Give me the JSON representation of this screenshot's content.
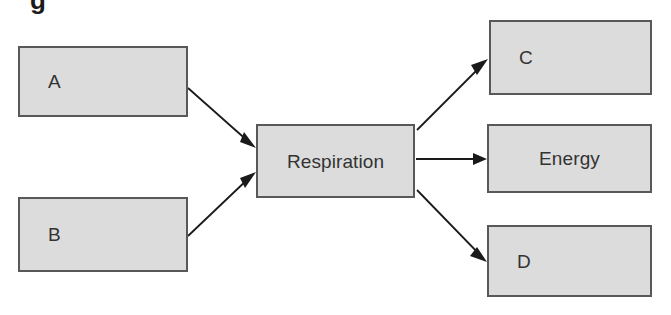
{
  "diagram": {
    "title_fragment": "g",
    "background_color": "#ffffff",
    "box_fill_color": "#dcdcdc",
    "box_border_color": "#585858",
    "arrow_color": "#1a1a1a",
    "text_color": "#333333",
    "nodes": [
      {
        "id": "a",
        "label": "A",
        "role": "input",
        "align": "left"
      },
      {
        "id": "b",
        "label": "B",
        "role": "input",
        "align": "left"
      },
      {
        "id": "respiration",
        "label": "Respiration",
        "role": "process",
        "align": "center"
      },
      {
        "id": "c",
        "label": "C",
        "role": "output",
        "align": "left"
      },
      {
        "id": "energy",
        "label": "Energy",
        "role": "output",
        "align": "center"
      },
      {
        "id": "d",
        "label": "D",
        "role": "output",
        "align": "left"
      }
    ],
    "edges": [
      {
        "from": "a",
        "to": "respiration",
        "direction": "down-right"
      },
      {
        "from": "b",
        "to": "respiration",
        "direction": "up-right"
      },
      {
        "from": "respiration",
        "to": "c",
        "direction": "up-right"
      },
      {
        "from": "respiration",
        "to": "energy",
        "direction": "right"
      },
      {
        "from": "respiration",
        "to": "d",
        "direction": "down-right"
      }
    ]
  }
}
